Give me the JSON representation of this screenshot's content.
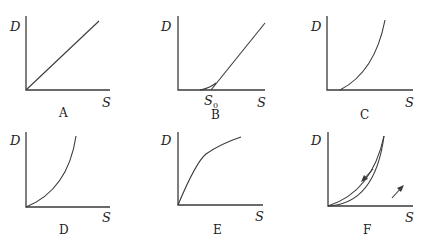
{
  "figure": {
    "panels": [
      {
        "id": "A",
        "caption": "A",
        "ylabel": "D",
        "xlabel": "S",
        "shape": "straight line through origin"
      },
      {
        "id": "B",
        "caption": "B",
        "ylabel": "D",
        "xlabel": "S",
        "shape": "line with threshold S0, curved toe",
        "annotation": "S",
        "annotation_sub": "0"
      },
      {
        "id": "C",
        "caption": "C",
        "ylabel": "D",
        "xlabel": "S",
        "shape": "convex curve starting at positive S"
      },
      {
        "id": "D",
        "caption": "D",
        "ylabel": "D",
        "xlabel": "S",
        "shape": "convex curve through origin"
      },
      {
        "id": "E",
        "caption": "E",
        "ylabel": "D",
        "xlabel": "S",
        "shape": "concave saturating curve"
      },
      {
        "id": "F",
        "caption": "F",
        "ylabel": "D",
        "xlabel": "S",
        "shape": "hysteresis loop with arrows (loading up lower, unloading down upper)"
      }
    ]
  }
}
